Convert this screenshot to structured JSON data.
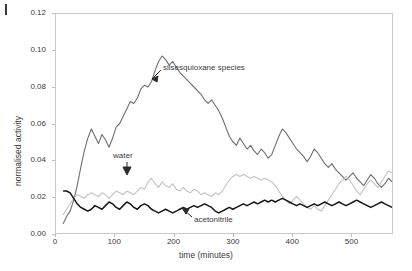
{
  "figure": {
    "corner_mark": "figure-rule-mark"
  },
  "axes": {
    "xlabel": "time (minutes)",
    "ylabel": "normalised activity",
    "xticks": [
      "0",
      "100",
      "200",
      "300",
      "400",
      "500"
    ],
    "xtick_values": [
      0,
      100,
      200,
      300,
      400,
      500
    ],
    "yticks": [
      "0.00",
      "0.02",
      "0.04",
      "0.06",
      "0.08",
      "0.10",
      "0.12"
    ],
    "ytick_values": [
      0.0,
      0.02,
      0.04,
      0.06,
      0.08,
      0.1,
      0.12
    ]
  },
  "annotations": [
    {
      "name": "silsesquioxane",
      "label": "silsesquioxane species"
    },
    {
      "name": "water",
      "label": "water"
    },
    {
      "name": "acetonitrile",
      "label": "acetonitrile"
    }
  ],
  "colors": {
    "silsesquioxane": "#6e6e6e",
    "water": "#c2c2c2",
    "acetonitrile": "#151515",
    "frame": "#c9c9c9",
    "text": "#3b3b3b",
    "background": "#ffffff"
  },
  "chart_data": {
    "type": "line",
    "title": "",
    "xlabel": "time (minutes)",
    "ylabel": "normalised activity",
    "xlim": [
      0,
      570
    ],
    "ylim": [
      0.0,
      0.12
    ],
    "grid": false,
    "legend": "inline-annotations",
    "x": [
      12,
      18,
      24,
      30,
      36,
      42,
      48,
      54,
      60,
      66,
      72,
      78,
      84,
      90,
      96,
      102,
      108,
      114,
      120,
      126,
      132,
      138,
      144,
      150,
      156,
      162,
      168,
      174,
      180,
      186,
      192,
      198,
      204,
      210,
      216,
      222,
      228,
      234,
      240,
      246,
      252,
      258,
      264,
      270,
      276,
      282,
      288,
      294,
      300,
      306,
      312,
      318,
      324,
      330,
      336,
      342,
      348,
      354,
      360,
      366,
      372,
      378,
      384,
      390,
      396,
      402,
      408,
      414,
      420,
      426,
      432,
      438,
      444,
      450,
      456,
      462,
      468,
      474,
      480,
      486,
      492,
      498,
      504,
      510,
      516,
      522,
      528,
      534,
      540,
      546,
      552,
      558,
      564,
      570
    ],
    "series": [
      {
        "name": "silsesquioxane species",
        "color": "#6e6e6e",
        "values": [
          0.005,
          0.009,
          0.012,
          0.018,
          0.026,
          0.036,
          0.045,
          0.052,
          0.057,
          0.053,
          0.049,
          0.054,
          0.051,
          0.047,
          0.052,
          0.058,
          0.06,
          0.064,
          0.068,
          0.072,
          0.071,
          0.074,
          0.079,
          0.081,
          0.08,
          0.083,
          0.089,
          0.094,
          0.097,
          0.095,
          0.092,
          0.094,
          0.091,
          0.088,
          0.086,
          0.084,
          0.082,
          0.08,
          0.078,
          0.076,
          0.073,
          0.071,
          0.073,
          0.07,
          0.067,
          0.063,
          0.058,
          0.053,
          0.05,
          0.048,
          0.052,
          0.049,
          0.046,
          0.048,
          0.045,
          0.043,
          0.046,
          0.044,
          0.041,
          0.043,
          0.048,
          0.053,
          0.057,
          0.055,
          0.052,
          0.049,
          0.046,
          0.044,
          0.042,
          0.039,
          0.042,
          0.046,
          0.044,
          0.041,
          0.038,
          0.036,
          0.038,
          0.035,
          0.033,
          0.031,
          0.029,
          0.031,
          0.033,
          0.03,
          0.028,
          0.026,
          0.029,
          0.032,
          0.03,
          0.027,
          0.025,
          0.027,
          0.03,
          0.028
        ]
      },
      {
        "name": "water",
        "color": "#c2c2c2",
        "values": [
          0.01,
          0.013,
          0.016,
          0.019,
          0.021,
          0.02,
          0.019,
          0.021,
          0.022,
          0.021,
          0.02,
          0.022,
          0.021,
          0.019,
          0.021,
          0.023,
          0.022,
          0.021,
          0.023,
          0.022,
          0.021,
          0.023,
          0.025,
          0.024,
          0.028,
          0.03,
          0.027,
          0.025,
          0.028,
          0.026,
          0.025,
          0.027,
          0.024,
          0.023,
          0.025,
          0.023,
          0.022,
          0.024,
          0.023,
          0.021,
          0.022,
          0.021,
          0.02,
          0.022,
          0.021,
          0.023,
          0.026,
          0.029,
          0.031,
          0.032,
          0.031,
          0.032,
          0.031,
          0.03,
          0.031,
          0.03,
          0.029,
          0.03,
          0.029,
          0.028,
          0.026,
          0.023,
          0.02,
          0.018,
          0.016,
          0.018,
          0.02,
          0.018,
          0.016,
          0.014,
          0.013,
          0.015,
          0.013,
          0.012,
          0.015,
          0.018,
          0.021,
          0.024,
          0.027,
          0.029,
          0.031,
          0.029,
          0.026,
          0.023,
          0.021,
          0.024,
          0.027,
          0.029,
          0.027,
          0.025,
          0.028,
          0.031,
          0.034,
          0.033
        ]
      },
      {
        "name": "acetonitrile",
        "color": "#151515",
        "values": [
          0.023,
          0.023,
          0.022,
          0.019,
          0.016,
          0.014,
          0.013,
          0.012,
          0.013,
          0.015,
          0.014,
          0.013,
          0.015,
          0.017,
          0.016,
          0.014,
          0.013,
          0.015,
          0.017,
          0.016,
          0.014,
          0.013,
          0.015,
          0.016,
          0.015,
          0.013,
          0.012,
          0.011,
          0.012,
          0.013,
          0.012,
          0.011,
          0.012,
          0.013,
          0.014,
          0.013,
          0.014,
          0.015,
          0.014,
          0.015,
          0.016,
          0.015,
          0.014,
          0.012,
          0.011,
          0.012,
          0.013,
          0.014,
          0.013,
          0.014,
          0.015,
          0.016,
          0.015,
          0.016,
          0.017,
          0.016,
          0.017,
          0.018,
          0.017,
          0.018,
          0.017,
          0.018,
          0.019,
          0.018,
          0.017,
          0.016,
          0.015,
          0.016,
          0.015,
          0.014,
          0.015,
          0.016,
          0.015,
          0.016,
          0.017,
          0.016,
          0.015,
          0.016,
          0.017,
          0.016,
          0.015,
          0.016,
          0.017,
          0.018,
          0.017,
          0.016,
          0.015,
          0.014,
          0.015,
          0.016,
          0.017,
          0.016,
          0.015,
          0.014
        ]
      }
    ]
  }
}
